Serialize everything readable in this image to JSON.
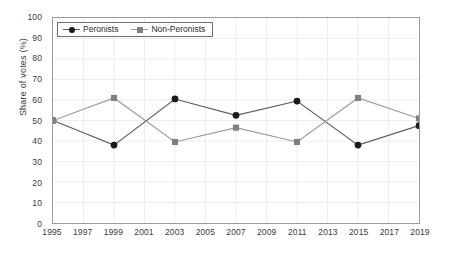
{
  "chart_data": {
    "type": "line",
    "title": "",
    "subtitle": "",
    "xlabel": "",
    "ylabel": "Share of votes (%)",
    "xlim": [
      1995,
      2019
    ],
    "ylim": [
      0,
      100
    ],
    "grid": true,
    "legend_position": "top-left",
    "x": [
      1995,
      1999,
      2003,
      2007,
      2011,
      2015,
      2019
    ],
    "xticks": [
      "1995",
      "1997",
      "1999",
      "2001",
      "2003",
      "2005",
      "2007",
      "2009",
      "2011",
      "2013",
      "2015",
      "2017",
      "2019"
    ],
    "yticks": [
      "0",
      "10",
      "20",
      "30",
      "40",
      "50",
      "60",
      "70",
      "80",
      "90",
      "100"
    ],
    "series": [
      {
        "name": "Peronists",
        "marker": "circle",
        "color": "#1a1a1a",
        "line_color": "#5a5a5a",
        "values": [
          50,
          38,
          60.5,
          52.5,
          59.5,
          38,
          47.5
        ]
      },
      {
        "name": "Non-Peronists",
        "marker": "square",
        "color": "#808080",
        "line_color": "#9a9a9a",
        "values": [
          50,
          61,
          39.5,
          46.5,
          39.5,
          61,
          51
        ]
      }
    ]
  },
  "axes": {
    "frame_color": "#9a9a9a",
    "grid_color": "#ededed",
    "tick_text_color": "#3b3b3b"
  }
}
